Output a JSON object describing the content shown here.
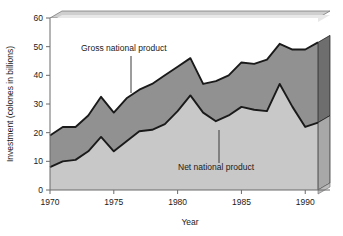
{
  "chart_data": {
    "type": "area",
    "title": "",
    "xlabel": "Year",
    "ylabel": "Investment (colones in billions)",
    "xlim": [
      1970,
      1991
    ],
    "ylim": [
      0,
      60
    ],
    "xticks": [
      1970,
      1975,
      1980,
      1985,
      1990
    ],
    "yticks": [
      0,
      10,
      20,
      30,
      40,
      50,
      60
    ],
    "grid": false,
    "legend_position": "inline-annotation",
    "stacked_overlay": true,
    "x": [
      1970,
      1971,
      1972,
      1973,
      1974,
      1975,
      1976,
      1977,
      1978,
      1979,
      1980,
      1981,
      1982,
      1983,
      1984,
      1985,
      1986,
      1987,
      1988,
      1989,
      1990,
      1991
    ],
    "series": [
      {
        "name": "Gross national product",
        "color": "#919191",
        "values": [
          19,
          22,
          22,
          26,
          32.5,
          27,
          32,
          35,
          37,
          40,
          43,
          46,
          37,
          38,
          40,
          44.5,
          44,
          45.5,
          51,
          49,
          49,
          51.5
        ]
      },
      {
        "name": "Net national product",
        "color": "#c8c8c8",
        "values": [
          8,
          10,
          10.5,
          13.5,
          18.5,
          13.5,
          17,
          20.5,
          21,
          23,
          27.5,
          33,
          27,
          24,
          26,
          29,
          28,
          27.5,
          37,
          29,
          22,
          23.5
        ]
      }
    ],
    "annotations": [
      {
        "text": "Gross national product",
        "x_px": 81,
        "y_px": 51,
        "leader_x_px": 131,
        "leader_y1_px": 56,
        "leader_y2_px": 93
      },
      {
        "text": "Net national product",
        "x_px": 178,
        "y_px": 170,
        "leader_x_px": 219,
        "leader_y1_px": 130,
        "leader_y2_px": 163
      }
    ]
  },
  "axes": {
    "ylabel": "Investment (colones in billions)",
    "xlabel": "Year",
    "ytick_labels": [
      "0",
      "10",
      "20",
      "30",
      "40",
      "50",
      "60"
    ],
    "xtick_labels": [
      "1970",
      "1975",
      "1980",
      "1985",
      "1990"
    ]
  },
  "style": {
    "background": "#ffffff",
    "plot_face": "#ffffff",
    "upper_band": "#919191",
    "lower_band": "#c8c8c8",
    "line_color": "#1a1a1a",
    "wall_top": "#cfcfcf",
    "wall_side": "#a8a8a8",
    "wall_side_dark": "#6e6e6e",
    "axis_color": "#6b6b6b",
    "faint_grid": "#e2e2e2"
  }
}
